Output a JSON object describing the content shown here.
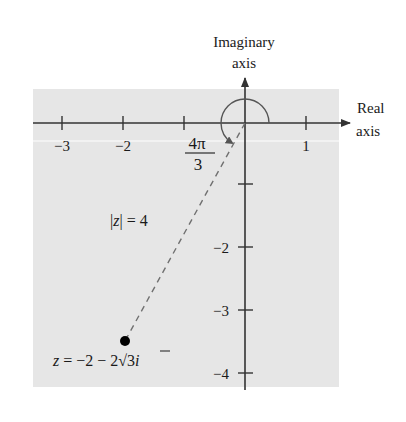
{
  "figure": {
    "type": "complex-plane",
    "background_color": "#e6e6e6",
    "axis_color": "#333333",
    "dash_color": "#707070",
    "point_color": "#000000"
  },
  "axes": {
    "imaginary_label_line1": "Imaginary",
    "imaginary_label_line2": "axis",
    "real_label_line1": "Real",
    "real_label_line2": "axis",
    "real_ticks": [
      {
        "value": -3,
        "label": "−3"
      },
      {
        "value": -2,
        "label": "−2"
      },
      {
        "value": -1,
        "label": ""
      },
      {
        "value": 1,
        "label": "1"
      }
    ],
    "imaginary_ticks": [
      {
        "value": -1,
        "label": ""
      },
      {
        "value": -2,
        "label": "−2"
      },
      {
        "value": -3,
        "label": "−3"
      },
      {
        "value": -4,
        "label": "−4"
      }
    ]
  },
  "annotations": {
    "angle_numerator": "4π",
    "angle_denominator": "3",
    "modulus_label": "|z| = 4",
    "modulus_bar_left": "|",
    "modulus_var": "z",
    "modulus_rest": "| = 4",
    "point_label_var": "z",
    "point_label_rest": " = −2 − 2",
    "point_label_sqrt": "√",
    "point_label_radicand": "3",
    "point_label_i": "i",
    "point_label_full": "z = −2 − 2√3 i"
  },
  "point": {
    "real": -2,
    "imag": -3.464,
    "modulus": 4,
    "argument": "4π/3"
  }
}
